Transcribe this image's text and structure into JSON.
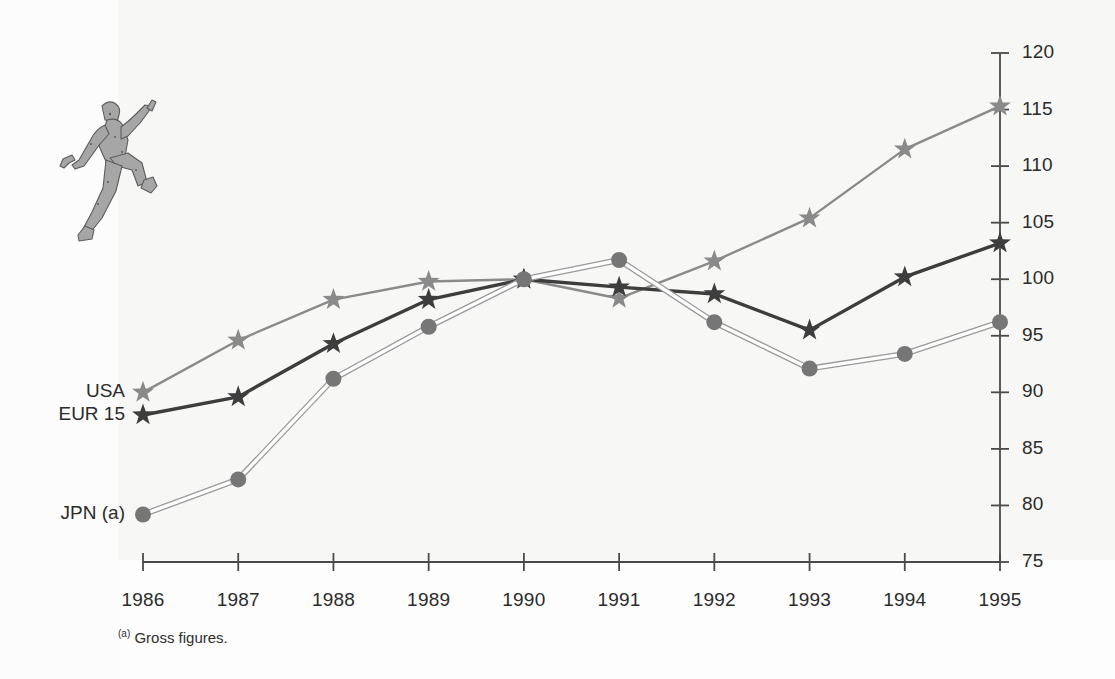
{
  "figure": {
    "footnote_marker": "(a)",
    "footnote_text": " Gross figures.",
    "mascot_name": "running-man-illustration"
  },
  "colors": {
    "usa_line": "#8a8a8a",
    "eur_line": "#3d3d3d",
    "jpn_line": "#9a9a9a",
    "jpn_marker": "#767676",
    "axis": "#4a4a4a",
    "text": "#2b2b2b",
    "background": "#fdfdfd"
  },
  "legend": {
    "items": [
      {
        "label": "USA",
        "marker": "star",
        "color": "#8a8a8a"
      },
      {
        "label": "EUR 15",
        "marker": "star",
        "color": "#3d3d3d"
      },
      {
        "label": "JPN (a)",
        "marker": "circle",
        "color": "#767676"
      }
    ]
  },
  "chart_data": {
    "type": "line",
    "title": "",
    "subtitle": "",
    "xlabel": "",
    "ylabel": "",
    "x": [
      1986,
      1987,
      1988,
      1989,
      1990,
      1991,
      1992,
      1993,
      1994,
      1995
    ],
    "categories": [
      "1986",
      "1987",
      "1988",
      "1989",
      "1990",
      "1991",
      "1992",
      "1993",
      "1994",
      "1995"
    ],
    "ylim": [
      75,
      120
    ],
    "yticks": [
      75,
      80,
      85,
      90,
      95,
      100,
      105,
      110,
      115,
      120
    ],
    "ytick_labels": [
      "75",
      "80",
      "85",
      "90",
      "95",
      "100",
      "105",
      "110",
      "115",
      "120"
    ],
    "y_axis_position": "right",
    "grid": false,
    "legend_position": "left-inline",
    "annotations": [
      "(a) Gross figures."
    ],
    "series": [
      {
        "name": "USA",
        "marker": "star",
        "color": "#8a8a8a",
        "values": [
          90.0,
          94.6,
          98.2,
          99.8,
          100.0,
          98.3,
          101.6,
          105.4,
          111.5,
          115.3
        ]
      },
      {
        "name": "EUR 15",
        "marker": "star",
        "color": "#3d3d3d",
        "values": [
          88.0,
          89.6,
          94.3,
          98.2,
          100.0,
          99.3,
          98.7,
          95.5,
          100.2,
          103.2
        ]
      },
      {
        "name": "JPN (a)",
        "marker": "circle",
        "color": "#767676",
        "values": [
          79.2,
          82.3,
          91.2,
          95.8,
          100.0,
          101.7,
          96.2,
          92.1,
          93.4,
          96.2
        ]
      }
    ]
  },
  "geometry": {
    "plot_left": 143,
    "plot_right": 1000,
    "plot_top": 53,
    "plot_bottom": 562,
    "y_min": 75,
    "y_max": 120
  }
}
